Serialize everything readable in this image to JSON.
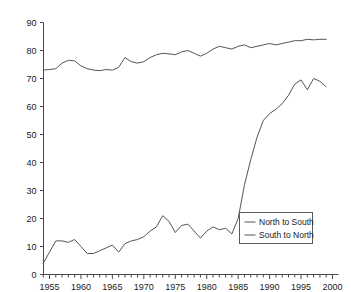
{
  "chart_data": {
    "type": "line",
    "title": "",
    "xlabel": "",
    "ylabel": "",
    "xlim": [
      1954,
      2000
    ],
    "ylim": [
      0,
      90
    ],
    "grid": false,
    "legend_position": "center-right",
    "yticks": [
      0,
      10,
      20,
      30,
      40,
      50,
      60,
      70,
      80,
      90
    ],
    "ytick_labels": [
      "0",
      "10",
      "20",
      "30",
      "40",
      "50",
      "60",
      "70",
      "80",
      "90"
    ],
    "xticks": [
      1955,
      1960,
      1965,
      1970,
      1975,
      1980,
      1985,
      1990,
      1995,
      2000
    ],
    "xtick_labels": [
      "1955",
      "1960",
      "1965",
      "1970",
      "1975",
      "1980",
      "1985",
      "1990",
      "1995",
      "2000"
    ],
    "minor_xtick_step": 1,
    "x": [
      1954,
      1955,
      1956,
      1957,
      1958,
      1959,
      1960,
      1961,
      1962,
      1963,
      1964,
      1965,
      1966,
      1967,
      1968,
      1969,
      1970,
      1971,
      1972,
      1973,
      1974,
      1975,
      1976,
      1977,
      1978,
      1979,
      1980,
      1981,
      1982,
      1983,
      1984,
      1985,
      1986,
      1987,
      1988,
      1989,
      1990,
      1991,
      1992,
      1993,
      1994,
      1995,
      1996,
      1997,
      1998,
      1999
    ],
    "series": [
      {
        "name": "North to South",
        "color": "#555555",
        "values": [
          73.0,
          73.2,
          73.5,
          75.5,
          76.5,
          76.3,
          74.5,
          73.5,
          73.0,
          72.8,
          73.2,
          73.0,
          74.0,
          77.5,
          76.0,
          75.5,
          76.0,
          77.5,
          78.5,
          79.0,
          78.8,
          78.5,
          79.5,
          80.0,
          79.0,
          78.0,
          79.0,
          80.5,
          81.5,
          81.0,
          80.5,
          81.5,
          82.0,
          81.0,
          81.5,
          82.0,
          82.5,
          82.0,
          82.5,
          83.0,
          83.5,
          83.5,
          84.0,
          83.8,
          84.0,
          84.0
        ]
      },
      {
        "name": "South to North",
        "color": "#555555",
        "values": [
          4.0,
          8.0,
          12.0,
          12.0,
          11.5,
          12.5,
          10.0,
          7.5,
          7.5,
          8.5,
          9.5,
          10.5,
          8.0,
          11.0,
          12.0,
          12.5,
          13.5,
          15.5,
          17.0,
          21.0,
          19.0,
          15.0,
          17.5,
          18.0,
          15.5,
          13.0,
          15.5,
          17.0,
          16.0,
          16.5,
          14.5,
          20.0,
          32.0,
          41.0,
          49.0,
          55.0,
          57.5,
          59.0,
          61.0,
          64.0,
          68.0,
          69.5,
          66.0,
          70.0,
          69.0,
          67.0
        ]
      }
    ]
  },
  "legend": {
    "entries": [
      {
        "label": "North to South"
      },
      {
        "label": "South to North"
      }
    ]
  }
}
